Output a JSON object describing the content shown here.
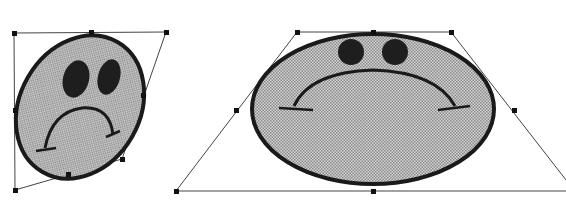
{
  "colors": {
    "outline": "#1a1a1a",
    "fill": "#b8b8b8",
    "eye": "#1e1e1e",
    "frame": "#333333",
    "handle": "#111111"
  },
  "shapes": [
    {
      "name": "skewed-face",
      "description": "Sad face distorted into tilted oval",
      "handles": [
        [
          14,
          33
        ],
        [
          91,
          32
        ],
        [
          166,
          32
        ],
        [
          143,
          95
        ],
        [
          122,
          159
        ],
        [
          68,
          174
        ],
        [
          15,
          190
        ],
        [
          15,
          110
        ]
      ]
    },
    {
      "name": "trapezoid-face",
      "description": "Sad face distorted with perspective trapezoid",
      "handles": [
        [
          297,
          32
        ],
        [
          373,
          32
        ],
        [
          451,
          32
        ],
        [
          514,
          110
        ],
        [
          566,
          191
        ],
        [
          373,
          191
        ],
        [
          176,
          191
        ],
        [
          236,
          110
        ]
      ]
    }
  ]
}
